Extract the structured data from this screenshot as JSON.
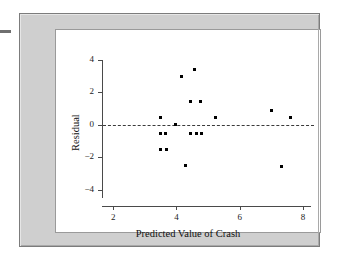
{
  "figure": {
    "background_color": "#cfcfcf",
    "panel_color": "#ffffff",
    "border_color": "#7c7c7c"
  },
  "chart_data": {
    "type": "scatter",
    "title": "",
    "xlabel": "Predicted Value of Crash",
    "ylabel": "Residual",
    "xlim": [
      1.55,
      8.35
    ],
    "ylim": [
      -4.75,
      4.6
    ],
    "xticks": [
      2,
      4,
      6,
      8
    ],
    "xtick_labels": [
      "2",
      "4",
      "6",
      "8"
    ],
    "yticks": [
      4,
      2,
      0,
      -2,
      -4
    ],
    "ytick_labels": [
      "4",
      "2",
      "0",
      "−2",
      "−4"
    ],
    "grid": false,
    "legend": null,
    "reference_lines": [
      {
        "name": "zero-residual-line",
        "orientation": "horizontal",
        "y": 0,
        "style": "dashed",
        "color": "#3a3a3a"
      }
    ],
    "marker": {
      "shape": "square",
      "color": "#000000",
      "size_px": 3
    },
    "points": [
      {
        "x": 3.48,
        "y": 0.45
      },
      {
        "x": 3.5,
        "y": -0.55
      },
      {
        "x": 3.66,
        "y": -0.55
      },
      {
        "x": 3.5,
        "y": -1.55
      },
      {
        "x": 3.68,
        "y": -1.55
      },
      {
        "x": 3.96,
        "y": 0.0
      },
      {
        "x": 4.15,
        "y": 2.95
      },
      {
        "x": 4.3,
        "y": -2.52
      },
      {
        "x": 4.45,
        "y": 1.42
      },
      {
        "x": 4.45,
        "y": -0.52
      },
      {
        "x": 4.58,
        "y": 3.4
      },
      {
        "x": 4.62,
        "y": -0.52
      },
      {
        "x": 4.76,
        "y": 1.42
      },
      {
        "x": 4.78,
        "y": -0.55
      },
      {
        "x": 5.22,
        "y": 0.45
      },
      {
        "x": 7.0,
        "y": 0.88
      },
      {
        "x": 7.32,
        "y": -2.58
      },
      {
        "x": 7.6,
        "y": 0.45
      }
    ]
  }
}
